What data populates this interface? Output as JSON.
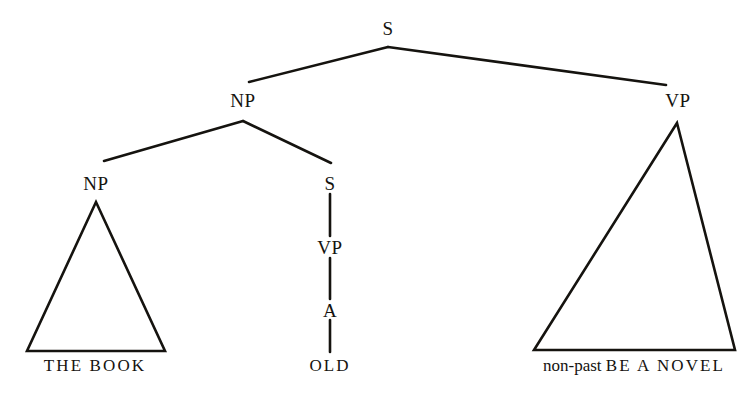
{
  "diagram": {
    "type": "syntax-tree",
    "title": "",
    "background_color": "#ffffff",
    "line_color": "#15130f",
    "text_color": "#15130f",
    "nodes": [
      {
        "id": "s-root",
        "label": "S",
        "x": 388,
        "y": 28
      },
      {
        "id": "np-subject",
        "label": "NP",
        "x": 243,
        "y": 100
      },
      {
        "id": "vp-main",
        "label": "VP",
        "x": 678,
        "y": 100
      },
      {
        "id": "np-inner",
        "label": "NP",
        "x": 96,
        "y": 183
      },
      {
        "id": "s-embedded",
        "label": "S",
        "x": 330,
        "y": 183
      },
      {
        "id": "vp-embedded",
        "label": "VP",
        "x": 330,
        "y": 247
      },
      {
        "id": "a-adjective",
        "label": "A",
        "x": 330,
        "y": 310
      }
    ],
    "terminals": [
      {
        "id": "terminal-the-book",
        "label": "THE BOOK",
        "x": 95,
        "y": 366,
        "style": "spaced-caps"
      },
      {
        "id": "terminal-old",
        "label": "OLD",
        "x": 330,
        "y": 366,
        "style": "spaced-caps"
      },
      {
        "id": "terminal-non-past-be-a-novel",
        "lower": "non-past ",
        "caps": "BE A NOVEL",
        "x": 634,
        "y": 366,
        "style": "mixed"
      }
    ],
    "branches": [
      {
        "id": "branch-s-to-np",
        "from": "s-root",
        "to": "np-subject",
        "x1": 388,
        "y1": 47,
        "x2": 249,
        "y2": 82
      },
      {
        "id": "branch-s-to-vp",
        "from": "s-root",
        "to": "vp-main",
        "x1": 388,
        "y1": 47,
        "x2": 666,
        "y2": 85
      },
      {
        "id": "branch-np-to-np",
        "from": "np-subject",
        "to": "np-inner",
        "x1": 243,
        "y1": 121,
        "x2": 104,
        "y2": 161
      },
      {
        "id": "branch-np-to-s",
        "from": "np-subject",
        "to": "s-embedded",
        "x1": 243,
        "y1": 121,
        "x2": 331,
        "y2": 163
      },
      {
        "id": "branch-s-to-vp-embedded",
        "from": "s-embedded",
        "to": "vp-embedded",
        "x1": 330,
        "y1": 194,
        "x2": 330,
        "y2": 236
      },
      {
        "id": "branch-vp-to-a",
        "from": "vp-embedded",
        "to": "a-adjective",
        "x1": 330,
        "y1": 258,
        "x2": 330,
        "y2": 299
      },
      {
        "id": "branch-a-to-old",
        "from": "a-adjective",
        "to": "terminal-old",
        "x1": 330,
        "y1": 320,
        "x2": 330,
        "y2": 352
      }
    ],
    "triangles": [
      {
        "id": "triangle-np-the-book",
        "apex_x": 96,
        "apex_y": 202,
        "left_x": 27,
        "right_x": 165,
        "base_y": 351
      },
      {
        "id": "triangle-vp-predicate",
        "apex_x": 677,
        "apex_y": 123,
        "left_x": 534,
        "right_x": 735,
        "base_y": 350
      }
    ]
  }
}
